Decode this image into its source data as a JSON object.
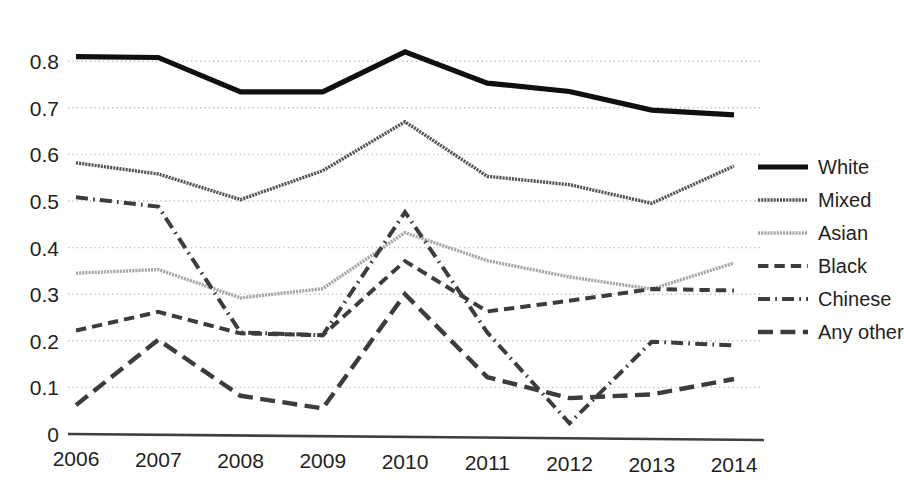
{
  "chart_data": {
    "type": "line",
    "title": "",
    "xlabel": "",
    "ylabel": "",
    "x": [
      "2006",
      "2007",
      "2008",
      "2009",
      "2010",
      "2011",
      "2012",
      "2013",
      "2014"
    ],
    "categories": [
      "2006",
      "2007",
      "2008",
      "2009",
      "2010",
      "2011",
      "2012",
      "2013",
      "2014"
    ],
    "ylim": [
      0,
      0.85
    ],
    "yticks": [
      0,
      0.1,
      0.2,
      0.3,
      0.4,
      0.5,
      0.6,
      0.7,
      0.8
    ],
    "ytick_labels": [
      "0",
      "0.1",
      "0.2",
      "0.3",
      "0.4",
      "0.5",
      "0.6",
      "0.7",
      "0.8"
    ],
    "grid": "horizontal-dotted",
    "legend_position": "right",
    "series": [
      {
        "name": "White",
        "values": [
          0.81,
          0.808,
          0.734,
          0.734,
          0.82,
          0.753,
          0.735,
          0.695,
          0.685
        ],
        "color": "#101010",
        "style": "solid",
        "width": 5.2
      },
      {
        "name": "Mixed",
        "values": [
          0.582,
          0.558,
          0.503,
          0.565,
          0.67,
          0.553,
          0.535,
          0.495,
          0.575
        ],
        "color": "#545454",
        "style": "dotted-fine",
        "width": 3.4
      },
      {
        "name": "Asian",
        "values": [
          0.345,
          0.353,
          0.292,
          0.312,
          0.432,
          0.372,
          0.337,
          0.311,
          0.367
        ],
        "color": "#a6a6a6",
        "style": "dotted-fine",
        "width": 3.4
      },
      {
        "name": "Black",
        "values": [
          0.222,
          0.262,
          0.216,
          0.212,
          0.371,
          0.263,
          0.286,
          0.311,
          0.308
        ],
        "color": "#3c3c3c",
        "style": "dashed",
        "width": 4.0
      },
      {
        "name": "Chinese",
        "values": [
          0.508,
          0.488,
          0.218,
          0.212,
          0.476,
          0.218,
          0.023,
          0.198,
          0.19
        ],
        "color": "#3c3c3c",
        "style": "dashdot",
        "width": 4.0
      },
      {
        "name": "Any other",
        "values": [
          0.062,
          0.202,
          0.082,
          0.055,
          0.3,
          0.122,
          0.077,
          0.085,
          0.118
        ],
        "color": "#3c3c3c",
        "style": "longdash",
        "width": 4.4
      }
    ]
  },
  "legend": {
    "items": [
      {
        "label": "White"
      },
      {
        "label": "Mixed"
      },
      {
        "label": "Asian"
      },
      {
        "label": "Black"
      },
      {
        "label": "Chinese"
      },
      {
        "label": "Any other"
      }
    ]
  },
  "axis_color": "#3f3f3f",
  "grid_color": "#b9b9b9"
}
